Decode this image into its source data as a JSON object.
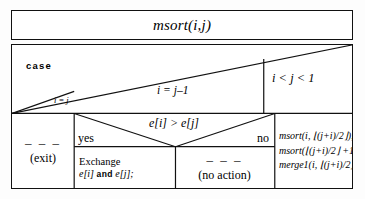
{
  "diagram": {
    "type": "nassi-shneiderman-structogram",
    "title": "msort(i,j)",
    "case_keyword": "case",
    "branches": [
      {
        "id": "branch-equal",
        "condition": "i = j",
        "body_lines": [
          "– – –",
          "(exit)"
        ]
      },
      {
        "id": "branch-adjacent",
        "condition": "i = j–1",
        "decision": {
          "condition": "e[i] > e[j]",
          "yes_label": "yes",
          "no_label": "no",
          "yes_body": {
            "line1": "Exchange",
            "line2_prefix": "e[i]",
            "line2_keyword": "and",
            "line2_suffix": "e[j];"
          },
          "no_body": {
            "dashes": "– – –",
            "text": "(no action)"
          }
        }
      },
      {
        "id": "branch-recursive",
        "condition": "i < j < 1",
        "code_lines": [
          "msort(i, ⌊(j+i)/2⌋);",
          "msort(⌊(j+i)/2⌋ +1, j);",
          "merge1(i, ⌊(j+i)/2⌋, j);"
        ]
      }
    ],
    "colors": {
      "ink": "#111111",
      "paper": "#ffffff",
      "page": "#fdfdfd"
    }
  }
}
